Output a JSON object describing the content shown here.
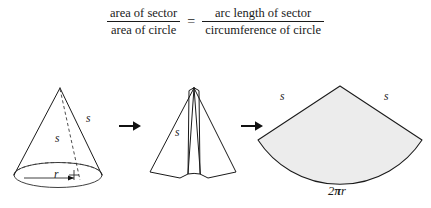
{
  "equation": {
    "left_fraction": {
      "numerator": "area of sector",
      "denominator": "area of circle"
    },
    "equals": "=",
    "right_fraction": {
      "numerator": "arc length of sector",
      "denominator": "circumference of circle"
    }
  },
  "figures": {
    "cone": {
      "slant_label_outer": "s",
      "slant_label_inner": "s",
      "radius_label": "r"
    },
    "arrow_1": "→",
    "unrolling_cone": {
      "slant_label": "s"
    },
    "arrow_2": "→",
    "sector": {
      "left_edge_label": "s",
      "right_edge_label": "s",
      "arc_label_prefix": "2",
      "arc_label_pi": "π",
      "arc_label_suffix": "r",
      "fill_color": "#ececec",
      "stroke_color": "#1a1a1a"
    }
  }
}
